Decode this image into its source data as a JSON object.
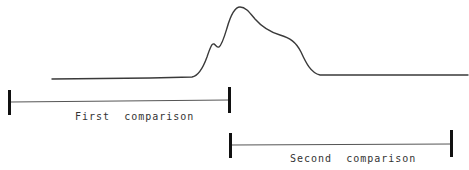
{
  "diagram": {
    "curve": {
      "name": "signal-trace",
      "color": "#3a3a3a",
      "points_description": "flat baseline, small shoulder peak, main peak, shoulder, return to baseline"
    },
    "ranges": [
      {
        "id": "first",
        "label": "First  comparison",
        "x_start": 9,
        "x_end": 229
      },
      {
        "id": "second",
        "label": "Second  comparison",
        "x_start": 230,
        "x_end": 451
      }
    ]
  }
}
